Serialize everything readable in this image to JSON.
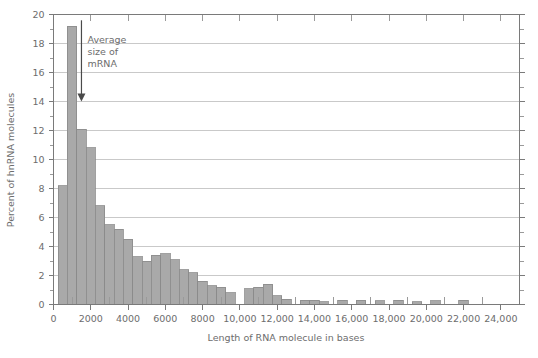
{
  "chart_data": {
    "type": "bar",
    "title": "",
    "subtitle": "",
    "xlabel": "Length of RNA molecule in bases",
    "ylabel": "Percent of hnRNA molecules",
    "xlim": [
      0,
      25000
    ],
    "ylim": [
      0,
      20
    ],
    "grid": true,
    "legend": null,
    "bin_width": 500,
    "x_tick_labels": [
      "0",
      "2000",
      "4000",
      "6000",
      "8000",
      "10,000",
      "12,000",
      "14,000",
      "16,000",
      "18,000",
      "20,000",
      "22,000",
      "24,000"
    ],
    "x_tick_values": [
      0,
      2000,
      4000,
      6000,
      8000,
      10000,
      12000,
      14000,
      16000,
      18000,
      20000,
      22000,
      24000
    ],
    "x_minor_step": 500,
    "y_tick_labels": [
      "0",
      "2",
      "4",
      "6",
      "8",
      "10",
      "12",
      "14",
      "16",
      "18",
      "20"
    ],
    "y_tick_values": [
      0,
      2,
      4,
      6,
      8,
      10,
      12,
      14,
      16,
      18,
      20
    ],
    "y_minor_step": 1,
    "bin_starts": [
      250,
      750,
      1250,
      1750,
      2250,
      2750,
      3250,
      3750,
      4250,
      4750,
      5250,
      5750,
      6250,
      6750,
      7250,
      7750,
      8250,
      8750,
      9250,
      9750,
      10250,
      10750,
      11250,
      11750,
      12250,
      12750,
      13250,
      13750,
      14250,
      15250,
      15750,
      16250,
      16750,
      17750,
      18250,
      18750,
      19250,
      19750,
      20750,
      22250,
      22750
    ],
    "values": [
      8.2,
      19.2,
      12.1,
      10.8,
      6.8,
      5.5,
      5.2,
      4.5,
      3.3,
      3.0,
      3.4,
      3.5,
      3.1,
      1.9,
      1.6,
      1.4,
      0.9,
      1.0,
      1.2,
      1.3,
      0.6,
      0.3,
      0.25,
      0.2,
      0.35,
      0.3,
      0.25,
      0.3,
      0.3,
      0.25,
      0.2,
      0.35,
      0.3,
      0.2,
      0.3,
      0.25,
      0.2,
      0.3,
      0.3,
      0.25,
      0.3
    ],
    "bars": [
      {
        "x0": 250,
        "x1": 750,
        "value": 8.2
      },
      {
        "x0": 750,
        "x1": 1250,
        "value": 19.2
      },
      {
        "x0": 1250,
        "x1": 1750,
        "value": 12.1
      },
      {
        "x0": 1750,
        "x1": 2250,
        "value": 10.8
      },
      {
        "x0": 2250,
        "x1": 2750,
        "value": 6.8
      },
      {
        "x0": 2750,
        "x1": 3250,
        "value": 5.5
      },
      {
        "x0": 3250,
        "x1": 3750,
        "value": 5.2
      },
      {
        "x0": 3750,
        "x1": 4250,
        "value": 4.5
      },
      {
        "x0": 4250,
        "x1": 4750,
        "value": 3.3
      },
      {
        "x0": 4750,
        "x1": 5250,
        "value": 3.0
      },
      {
        "x0": 5250,
        "x1": 5750,
        "value": 3.4
      },
      {
        "x0": 5750,
        "x1": 6250,
        "value": 3.5
      },
      {
        "x0": 6250,
        "x1": 6750,
        "value": 3.1
      },
      {
        "x0": 6750,
        "x1": 7250,
        "value": 2.4
      },
      {
        "x0": 7250,
        "x1": 7750,
        "value": 2.2
      },
      {
        "x0": 7750,
        "x1": 8250,
        "value": 1.6
      },
      {
        "x0": 8250,
        "x1": 8750,
        "value": 1.3
      },
      {
        "x0": 8750,
        "x1": 9250,
        "value": 1.2
      },
      {
        "x0": 9250,
        "x1": 9750,
        "value": 0.8
      },
      {
        "x0": 10250,
        "x1": 10750,
        "value": 1.1
      },
      {
        "x0": 10750,
        "x1": 11250,
        "value": 1.2
      },
      {
        "x0": 11250,
        "x1": 11750,
        "value": 1.4
      },
      {
        "x0": 11750,
        "x1": 12250,
        "value": 0.6
      },
      {
        "x0": 12250,
        "x1": 12750,
        "value": 0.35
      },
      {
        "x0": 13250,
        "x1": 13750,
        "value": 0.3
      },
      {
        "x0": 13750,
        "x1": 14250,
        "value": 0.3
      },
      {
        "x0": 14250,
        "x1": 14750,
        "value": 0.2
      },
      {
        "x0": 15250,
        "x1": 15750,
        "value": 0.3
      },
      {
        "x0": 16250,
        "x1": 16750,
        "value": 0.3
      },
      {
        "x0": 17250,
        "x1": 17750,
        "value": 0.25
      },
      {
        "x0": 18250,
        "x1": 18750,
        "value": 0.3
      },
      {
        "x0": 19250,
        "x1": 19750,
        "value": 0.2
      },
      {
        "x0": 20250,
        "x1": 20750,
        "value": 0.25
      },
      {
        "x0": 21750,
        "x1": 22250,
        "value": 0.3
      }
    ],
    "annotations": [
      {
        "name": "average-mrna-size",
        "lines": [
          "Average",
          "size of",
          "mRNA"
        ],
        "text": "Average size of mRNA",
        "x_value": 1500,
        "points_to_y": 14.0
      }
    ],
    "colors": {
      "bar_fill": "#a9a9a9",
      "bar_stroke": "#8a8a8a",
      "grid": "#c9c9c9",
      "axis": "#7a7a7a",
      "text": "#6d6d6d",
      "arrow": "#4a4a4a",
      "background": "#ffffff"
    }
  }
}
